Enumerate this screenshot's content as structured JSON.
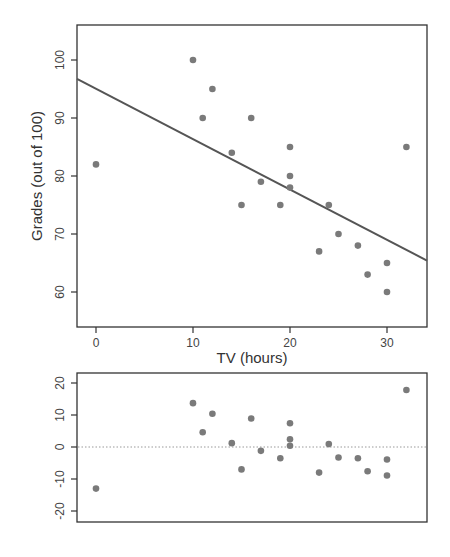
{
  "chart_data": [
    {
      "type": "scatter",
      "title": "",
      "xlabel": "TV (hours)",
      "ylabel": "Grades (out of 100)",
      "xlim": [
        -2,
        34
      ],
      "ylim": [
        54,
        106
      ],
      "x_ticks": [
        0,
        10,
        20,
        30
      ],
      "y_ticks": [
        60,
        70,
        80,
        90,
        100
      ],
      "grid": false,
      "legend": null,
      "points": [
        {
          "x": 0,
          "y": 82
        },
        {
          "x": 10,
          "y": 100
        },
        {
          "x": 11,
          "y": 90
        },
        {
          "x": 12,
          "y": 95
        },
        {
          "x": 14,
          "y": 84
        },
        {
          "x": 15,
          "y": 75
        },
        {
          "x": 16,
          "y": 90
        },
        {
          "x": 17,
          "y": 79
        },
        {
          "x": 19,
          "y": 75
        },
        {
          "x": 20,
          "y": 85
        },
        {
          "x": 20,
          "y": 80
        },
        {
          "x": 20,
          "y": 78
        },
        {
          "x": 23,
          "y": 67
        },
        {
          "x": 24,
          "y": 75
        },
        {
          "x": 25,
          "y": 70
        },
        {
          "x": 27,
          "y": 68
        },
        {
          "x": 28,
          "y": 63
        },
        {
          "x": 30,
          "y": 65
        },
        {
          "x": 30,
          "y": 60
        },
        {
          "x": 32,
          "y": 85
        }
      ],
      "regression_line": {
        "intercept": 95.0,
        "slope": -0.87
      }
    },
    {
      "type": "scatter",
      "title": "",
      "xlabel": "",
      "ylabel": "",
      "xlim": [
        -2,
        34
      ],
      "ylim": [
        -23,
        23
      ],
      "x_ticks": [],
      "y_ticks": [
        -20,
        -10,
        0,
        10,
        20
      ],
      "grid": false,
      "reference_line": {
        "y": 0,
        "style": "dotted"
      },
      "points": [
        {
          "x": 0,
          "y": -13.0
        },
        {
          "x": 10,
          "y": 13.7
        },
        {
          "x": 11,
          "y": 4.6
        },
        {
          "x": 12,
          "y": 10.4
        },
        {
          "x": 14,
          "y": 1.2
        },
        {
          "x": 15,
          "y": -7.0
        },
        {
          "x": 16,
          "y": 8.9
        },
        {
          "x": 17,
          "y": -1.2
        },
        {
          "x": 19,
          "y": -3.5
        },
        {
          "x": 20,
          "y": 7.4
        },
        {
          "x": 20,
          "y": 2.4
        },
        {
          "x": 20,
          "y": 0.4
        },
        {
          "x": 23,
          "y": -8.0
        },
        {
          "x": 24,
          "y": 0.9
        },
        {
          "x": 25,
          "y": -3.3
        },
        {
          "x": 27,
          "y": -3.5
        },
        {
          "x": 28,
          "y": -7.6
        },
        {
          "x": 30,
          "y": -3.9
        },
        {
          "x": 30,
          "y": -8.9
        },
        {
          "x": 32,
          "y": 17.8
        }
      ]
    }
  ],
  "colors": {
    "point": "#7a7a7a",
    "line": "#555555",
    "frame": "#333333",
    "dotted": "#999999"
  }
}
